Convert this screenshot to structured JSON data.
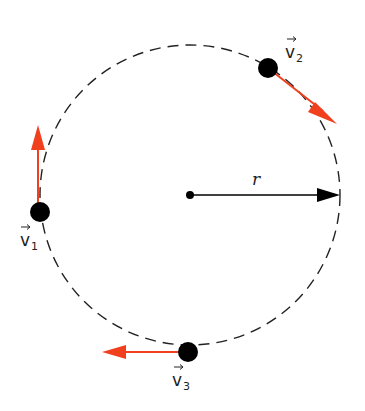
{
  "diagram": {
    "type": "uniform-circular-motion",
    "center": {
      "x": 190,
      "y": 195
    },
    "radius_px": 150,
    "radius_label": "r",
    "colors": {
      "velocity_arrow": "#f0401e",
      "radius_arrow": "#000000",
      "circle": "#222222",
      "object": "#000000"
    },
    "objects": [
      {
        "id": "v1",
        "label": "v",
        "subscript": "1",
        "position": "left",
        "x": 40,
        "y": 212,
        "arrow_direction": "up"
      },
      {
        "id": "v2",
        "label": "v",
        "subscript": "2",
        "position": "upper-right",
        "x": 268,
        "y": 68,
        "arrow_direction": "down-right"
      },
      {
        "id": "v3",
        "label": "v",
        "subscript": "3",
        "position": "bottom",
        "x": 188,
        "y": 352,
        "arrow_direction": "left"
      }
    ]
  }
}
